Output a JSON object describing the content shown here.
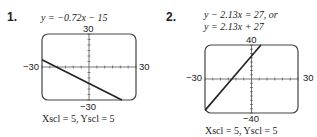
{
  "problems": [
    {
      "number": "1.",
      "equation_lines": [
        "y = −0.72x − 15"
      ],
      "window": {
        "xmin": "−30",
        "xmax": "30",
        "ymin": "−30",
        "ymax": "30"
      },
      "scale": "Xscl = 5, Yscl = 5"
    },
    {
      "number": "2.",
      "equation_lines": [
        "y − 2.13x = 27, or",
        "y = 2.13x + 27"
      ],
      "window": {
        "xmin": "−30",
        "xmax": "30",
        "ymin": "−40",
        "ymax": "40"
      },
      "scale": "Xscl = 5, Yscl = 5"
    }
  ],
  "chart_data": [
    {
      "type": "line",
      "title": "y = −0.72x − 15",
      "xlim": [
        -30,
        30
      ],
      "ylim": [
        -30,
        30
      ],
      "xscl": 5,
      "yscl": 5,
      "series": [
        {
          "name": "y = -0.72x - 15",
          "x": [
            -30,
            21
          ],
          "y": [
            6.6,
            -30
          ]
        }
      ]
    },
    {
      "type": "line",
      "title": "y = 2.13x + 27",
      "xlim": [
        -30,
        30
      ],
      "ylim": [
        -40,
        40
      ],
      "xscl": 5,
      "yscl": 5,
      "series": [
        {
          "name": "y = 2.13x + 27",
          "x": [
            -30,
            6.1
          ],
          "y": [
            -36.9,
            40
          ]
        }
      ]
    }
  ]
}
